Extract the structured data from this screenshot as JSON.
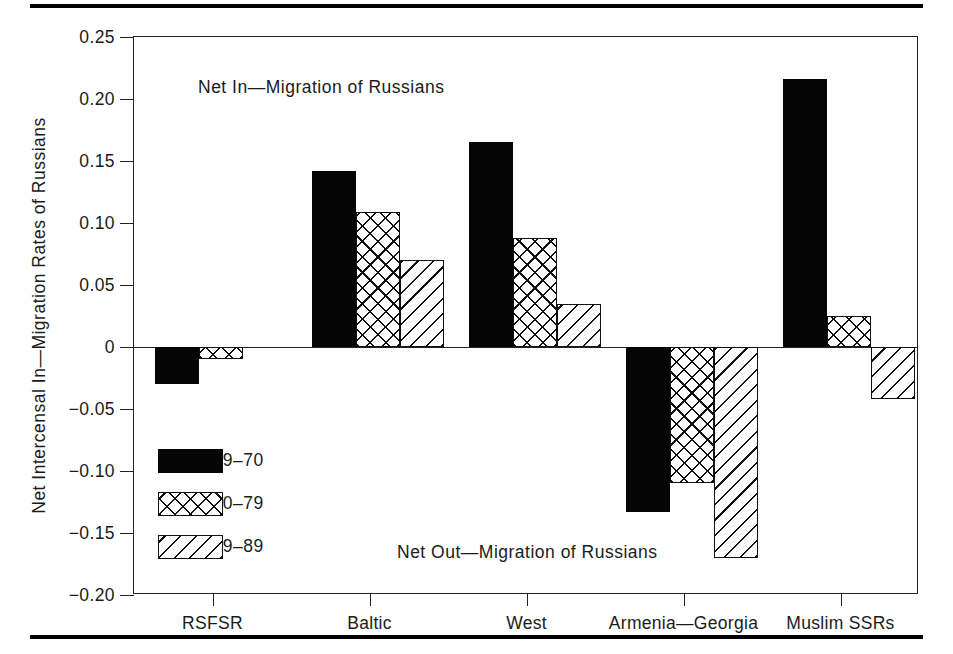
{
  "figure": {
    "top_rule": "horizontal-rule",
    "bottom_rule": "horizontal-rule"
  },
  "chart_data": {
    "type": "bar",
    "title": "",
    "xlabel": "",
    "ylabel": "Net Intercensal In—Migration Rates of Russians",
    "ylim": [
      -0.2,
      0.25
    ],
    "yticks": [
      0.25,
      0.2,
      0.15,
      0.1,
      0.05,
      0,
      -0.05,
      -0.1,
      -0.15,
      -0.2
    ],
    "ytick_labels": [
      "0.25",
      "0.20",
      "0.15",
      "0.10",
      "0.05",
      "0",
      "−0.05",
      "−0.10",
      "−0.15",
      "−0.20"
    ],
    "grid": false,
    "legend_position": "lower-left-inside",
    "categories": [
      "RSFSR",
      "Baltic",
      "West",
      "Armenia—Georgia",
      "Muslim SSRs"
    ],
    "series": [
      {
        "name": "1959‒70",
        "pattern": "solid",
        "values": [
          -0.03,
          0.142,
          0.165,
          -0.133,
          0.216
        ]
      },
      {
        "name": "1970‒79",
        "pattern": "crosshatch",
        "values": [
          -0.01,
          0.109,
          0.088,
          -0.11,
          0.025
        ]
      },
      {
        "name": "1979‒89",
        "pattern": "diagonal",
        "values": [
          0.0,
          0.07,
          0.035,
          -0.17,
          -0.042
        ]
      }
    ],
    "annotations": [
      {
        "text": "Net In—Migration of Russians",
        "position": "upper-left"
      },
      {
        "text": "Net Out—Migration of Russians",
        "position": "lower-center"
      }
    ]
  }
}
